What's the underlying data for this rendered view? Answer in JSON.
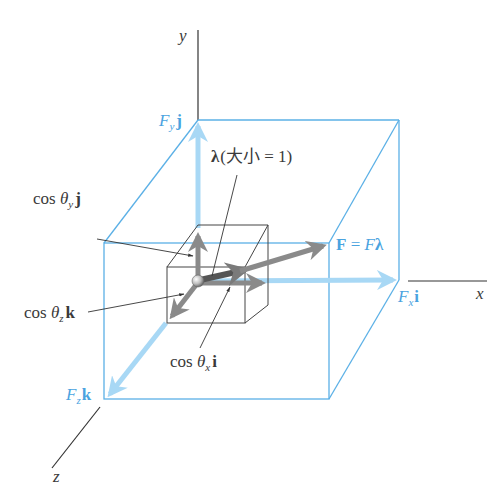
{
  "figure": {
    "colors": {
      "box_blue": "#5bb0e6",
      "component_arrow_blue": "#a8d8f5",
      "label_blue": "#4aa3df",
      "unit_vector_gray": "#8a8a8a",
      "axis_black": "#333333",
      "text_dark": "#3a3a3a"
    },
    "axes": {
      "x": "x",
      "y": "y",
      "z": "z"
    },
    "labels": {
      "Fy": {
        "main": "F",
        "sub": "y",
        "vec": "j"
      },
      "Fx": {
        "main": "F",
        "sub": "x",
        "vec": "i"
      },
      "Fz": {
        "main": "F",
        "sub": "z",
        "vec": "k"
      },
      "F_eq": {
        "lhs": "F",
        "eq": " = ",
        "rhs_F": "F",
        "rhs_lambda": "λ"
      },
      "lambda": {
        "symbol": "λ",
        "note": "(大小 = 1)"
      },
      "cos_y": {
        "cos": "cos ",
        "theta": "θ",
        "sub": "y",
        "vec": "j"
      },
      "cos_z": {
        "cos": "cos ",
        "theta": "θ",
        "sub": "z",
        "vec": "k"
      },
      "cos_x": {
        "cos": "cos ",
        "theta": "θ",
        "sub": "x",
        "vec": "i"
      }
    }
  }
}
